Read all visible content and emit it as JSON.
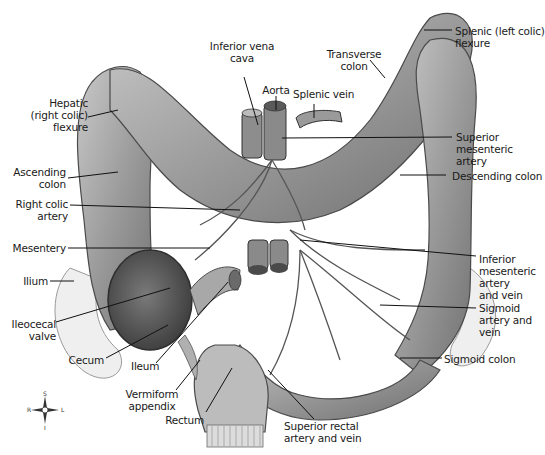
{
  "diagram": {
    "palette": {
      "tissue": "#9a9a9a",
      "tissue_dark": "#5e5e5e",
      "tissue_light": "#cfcfcf",
      "line": "#111111",
      "background": "#ffffff"
    },
    "labels": {
      "hepatic_flexure": "Hepatic\n(right colic)\nflexure",
      "inferior_vena_cava": "Inferior vena\ncava",
      "aorta": "Aorta",
      "splenic_vein": "Splenic vein",
      "transverse_colon": "Transverse\ncolon",
      "splenic_flexure": "Splenic (left colic)\nflexure",
      "superior_mesenteric_artery": "Superior\nmesenteric\nartery",
      "descending_colon": "Descending colon",
      "ascending_colon": "Ascending\ncolon",
      "right_colic_artery": "Right colic\nartery",
      "mesentery": "Mesentery",
      "ilium": "Ilium",
      "ileocecal_valve": "Ileocecal\nvalve",
      "cecum": "Cecum",
      "ileum": "Ileum",
      "vermiform_appendix": "Vermiform\nappendix",
      "rectum": "Rectum",
      "superior_rectal": "Superior rectal\nartery and vein",
      "inferior_mesenteric": "Inferior\nmesenteric\nartery\nand vein",
      "sigmoid_artery": "Sigmoid\nartery and\nvein",
      "sigmoid_colon": "Sigmoid colon"
    },
    "compass": {
      "top": "S",
      "bottom": "I",
      "left": "R",
      "right": "L"
    }
  }
}
